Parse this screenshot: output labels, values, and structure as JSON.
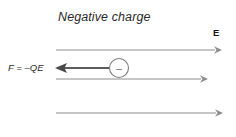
{
  "figure": {
    "title": "Negative charge",
    "field_label": "E",
    "force_label": "F = –QE",
    "charge_symbol": "–",
    "colors": {
      "background": "#ffffff",
      "field_line": "#8d8d8d",
      "force_line": "#5d5d5d",
      "force_arrowhead": "#4a4a4a",
      "title_text": "#2a2a2a",
      "charge_outline": "#7d7d7d"
    },
    "field_lines": [
      {
        "name": "field-line-top",
        "x1": 56,
        "y1": 50,
        "x2": 222,
        "y2": 50,
        "direction": "right"
      },
      {
        "name": "field-line-middle",
        "x1": 56,
        "y1": 79,
        "x2": 208,
        "y2": 79,
        "direction": "right"
      },
      {
        "name": "field-line-bottom",
        "x1": 56,
        "y1": 113,
        "x2": 223,
        "y2": 113,
        "direction": "right"
      }
    ],
    "force_arrow": {
      "x1": 110,
      "y1": 68,
      "x2": 55,
      "y2": 68,
      "direction": "left"
    },
    "charge": {
      "cx": 119,
      "cy": 68,
      "r": 9.5
    },
    "title_position": {
      "x": 58,
      "y": 21
    },
    "field_label_position": {
      "x": 213,
      "y": 36
    },
    "force_label_position": {
      "x": 8,
      "y": 71
    }
  }
}
